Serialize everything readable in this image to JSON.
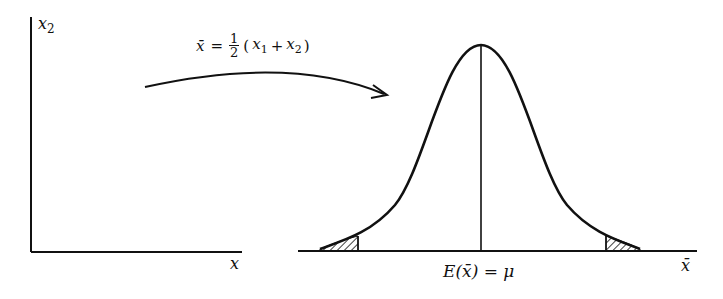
{
  "diagram": {
    "left_plot": {
      "y_axis_label": "x",
      "y_axis_label_subscript": "2",
      "x_axis_label": "x"
    },
    "transform": {
      "lhs": "x̄",
      "equals": "=",
      "frac_num": "1",
      "frac_den": "2",
      "paren_open": "(",
      "x1": "x",
      "x1_sub": "1",
      "plus": "+",
      "x2": "x",
      "x2_sub": "2",
      "paren_close": ")"
    },
    "right_plot": {
      "center_label": "E(x̄) = μ",
      "x_axis_label": "x̄",
      "curve": "normal distribution",
      "shaded_tails": [
        "left-tail",
        "right-tail"
      ]
    },
    "colors": {
      "ink": "#111111",
      "background": "#ffffff"
    }
  }
}
